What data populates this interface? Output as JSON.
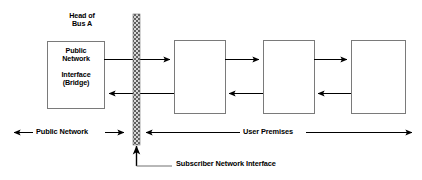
{
  "diagram": {
    "colors": {
      "line": "#000000",
      "box_border": "#7a7a7a",
      "box_fill": "#ffffff",
      "hatch_dark": "#6b6b6b",
      "hatch_light": "#d8d8d8",
      "background": "#ffffff"
    },
    "head_of_bus": {
      "label_line1": "Head of",
      "label_line2": "Bus A"
    },
    "public_network_interface": {
      "line1": "Public",
      "line2": "Network",
      "line3": "Interface",
      "line4": "(Bridge)"
    },
    "nodes": [
      {
        "id": "node-1",
        "label": ""
      },
      {
        "id": "node-2",
        "label": ""
      },
      {
        "id": "node-3",
        "label": ""
      }
    ],
    "boundary": {
      "name": "subscriber-network-interface",
      "callout_label": "Subscriber Network Interface"
    },
    "demarcations": {
      "left_label": "Public Network",
      "right_label": "User Premises"
    }
  }
}
